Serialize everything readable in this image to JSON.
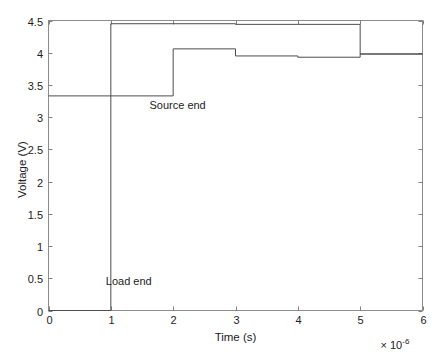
{
  "chart_data": {
    "type": "line",
    "title": "",
    "xlabel": "Time (s)",
    "ylabel": "Voltage (V)",
    "x_exponent_prefix": "× 10",
    "x_exponent_power": "-6",
    "xlim": [
      0,
      6
    ],
    "ylim": [
      0,
      4.5
    ],
    "xticks": [
      "0",
      "1",
      "2",
      "3",
      "4",
      "5",
      "6"
    ],
    "xtick_values": [
      0,
      1,
      2,
      3,
      4,
      5,
      6
    ],
    "yticks": [
      "0",
      "0.5",
      "1",
      "1.5",
      "2",
      "2.5",
      "3",
      "3.5",
      "4",
      "4.5"
    ],
    "ytick_values": [
      0,
      0.5,
      1,
      1.5,
      2,
      2.5,
      3,
      3.5,
      4,
      4.5
    ],
    "grid": false,
    "legend_position": "none",
    "box": true,
    "line_color": "#4d4d4d",
    "axis_color": "#808080",
    "background": "#ffffff",
    "annotations": [
      {
        "text": "Source end",
        "x": 1.62,
        "y": 3.18
      },
      {
        "text": "Load end",
        "x": 0.92,
        "y": 0.44
      }
    ],
    "series": [
      {
        "name": "Source end",
        "step": "post",
        "x": [
          0,
          2,
          3,
          4,
          5,
          6
        ],
        "values": [
          3.33,
          4.06,
          3.95,
          3.93,
          3.98,
          3.98
        ]
      },
      {
        "name": "Load end",
        "step": "post",
        "x": [
          0,
          1,
          3,
          4,
          5,
          6
        ],
        "values": [
          0.0,
          4.45,
          4.44,
          4.44,
          3.98,
          3.98
        ]
      }
    ]
  },
  "caption": {
    "text": ""
  }
}
